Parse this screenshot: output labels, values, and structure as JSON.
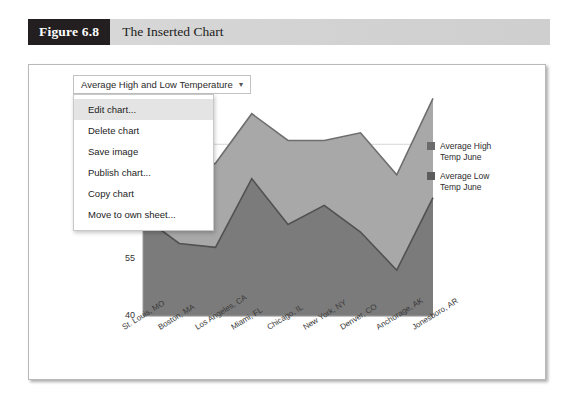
{
  "figure": {
    "number": "Figure 6.8",
    "title": "The Inserted Chart"
  },
  "chart_card": {
    "title_button": {
      "label": "Average High and Low Temperature",
      "caret": "▾"
    },
    "context_menu": {
      "items": [
        {
          "label": "Edit chart...",
          "highlighted": true
        },
        {
          "label": "Delete chart",
          "highlighted": false
        },
        {
          "label": "Save image",
          "highlighted": false
        },
        {
          "label": "Publish chart...",
          "highlighted": false
        },
        {
          "label": "Copy chart",
          "highlighted": false
        },
        {
          "label": "Move to own sheet...",
          "highlighted": false
        }
      ]
    }
  },
  "colors": {
    "high_series": "#a8a8a8",
    "low_series": "#7b7b7b",
    "high_series_line": "#6e6e6e",
    "low_series_line": "#515151",
    "legend_swatch_high": "#6b6b6b",
    "legend_swatch_low": "#5c5c5c",
    "gridline": "#d5d5d5",
    "axis": "#9a9a9a",
    "caption_bar": "#d4d4d4",
    "caption_number_bg": "#231f20"
  },
  "chart_data": {
    "type": "area",
    "title": "Average High and Low Temperature",
    "xlabel": "",
    "ylabel": "",
    "ylim": [
      40,
      100
    ],
    "yticks": [
      40,
      55,
      70,
      85
    ],
    "ytick_labels": [
      "40",
      "55",
      "70",
      "85"
    ],
    "grid": true,
    "legend_position": "right",
    "categories": [
      "St. Louis, MO",
      "Boston, MA",
      "Los Angeles, CA",
      "Miami, FL",
      "Chicago, IL",
      "New York, NY",
      "Denver, CO",
      "Anchorage, AK",
      "Jonesboro, AR"
    ],
    "series": [
      {
        "name": "Average High Temp June",
        "values": [
          85,
          76,
          80,
          93,
          86,
          86,
          88,
          77,
          97
        ]
      },
      {
        "name": "Average Low Temp June",
        "values": [
          66,
          59,
          58,
          76,
          64,
          69,
          62,
          52,
          71
        ]
      }
    ]
  }
}
